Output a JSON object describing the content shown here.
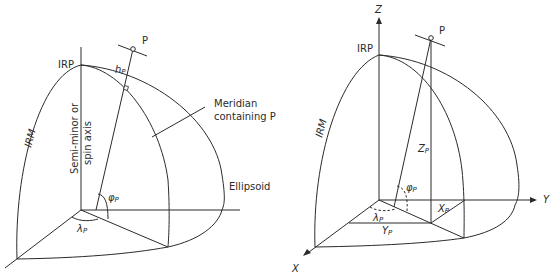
{
  "left_diagram": {
    "labels": {
      "point": "P",
      "irp": "IRP",
      "irm": "IRM",
      "height": "h",
      "height_sub": "P",
      "meridian_line1": "Meridian",
      "meridian_line2": "containing P",
      "axis_line1": "Semi-minor or",
      "axis_line2": "spin axis",
      "ellipsoid": "Ellipsoid",
      "latitude": "φ",
      "latitude_sub": "P",
      "longitude": "λ",
      "longitude_sub": "P"
    }
  },
  "right_diagram": {
    "labels": {
      "z_axis": "Z",
      "y_axis": "Y",
      "x_axis": "X",
      "point": "P",
      "irp": "IRP",
      "irm": "IRM",
      "zp": "Z",
      "zp_sub": "P",
      "xp": "X",
      "xp_sub": "P",
      "yp": "Y",
      "yp_sub": "P",
      "latitude": "φ",
      "latitude_sub": "P",
      "longitude": "λ",
      "longitude_sub": "P"
    }
  },
  "colors": {
    "line": "#2b2b2b",
    "background": "#ffffff"
  }
}
